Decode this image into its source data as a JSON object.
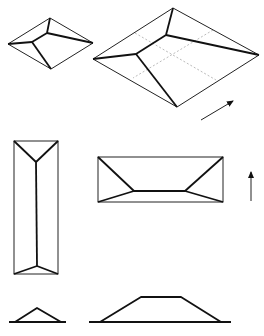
{
  "figure": {
    "colors": {
      "line": "#111111",
      "guide": "#aaaaaa",
      "background": "#ffffff"
    },
    "small_iso": {
      "outline": [
        [
          50,
          18
        ],
        [
          93,
          43
        ],
        [
          51,
          69
        ],
        [
          8,
          44
        ]
      ],
      "ridges": [
        [
          [
            50,
            18
          ],
          [
            47,
            33
          ]
        ],
        [
          [
            47,
            33
          ],
          [
            93,
            43
          ]
        ],
        [
          [
            47,
            33
          ],
          [
            32,
            42
          ]
        ],
        [
          [
            32,
            42
          ],
          [
            8,
            44
          ]
        ],
        [
          [
            32,
            42
          ],
          [
            51,
            69
          ]
        ]
      ]
    },
    "large_iso": {
      "outline": [
        [
          173,
          8
        ],
        [
          259,
          55
        ],
        [
          177,
          107
        ],
        [
          93,
          59
        ]
      ],
      "ridges": [
        [
          [
            173,
            8
          ],
          [
            166,
            35
          ]
        ],
        [
          [
            166,
            35
          ],
          [
            259,
            55
          ]
        ],
        [
          [
            166,
            35
          ],
          [
            136,
            54
          ]
        ],
        [
          [
            136,
            54
          ],
          [
            93,
            59
          ]
        ],
        [
          [
            136,
            54
          ],
          [
            177,
            107
          ]
        ]
      ],
      "guides": [
        [
          [
            135,
            33
          ],
          [
            216,
            80
          ]
        ],
        [
          [
            213,
            30
          ],
          [
            133,
            78
          ]
        ]
      ]
    },
    "iso_arrow": {
      "from": [
        201,
        120
      ],
      "to": [
        233,
        101
      ],
      "icon": "arrow-up-right-icon"
    },
    "plan_tall": {
      "rect": [
        14,
        141,
        58,
        274
      ],
      "ridges": [
        [
          [
            14,
            141
          ],
          [
            36,
            162
          ]
        ],
        [
          [
            58,
            141
          ],
          [
            36,
            162
          ]
        ],
        [
          [
            36,
            162
          ],
          [
            37,
            266
          ]
        ],
        [
          [
            37,
            266
          ],
          [
            14,
            274
          ]
        ],
        [
          [
            37,
            266
          ],
          [
            58,
            274
          ]
        ]
      ]
    },
    "plan_wide": {
      "rect": [
        98,
        157,
        223,
        202
      ],
      "ridges": [
        [
          [
            98,
            157
          ],
          [
            134,
            191
          ]
        ],
        [
          [
            223,
            157
          ],
          [
            185,
            191
          ]
        ],
        [
          [
            134,
            191
          ],
          [
            185,
            191
          ]
        ],
        [
          [
            134,
            191
          ],
          [
            98,
            202
          ]
        ],
        [
          [
            185,
            191
          ],
          [
            223,
            202
          ]
        ]
      ]
    },
    "plan_arrow": {
      "from": [
        251,
        201
      ],
      "to": [
        251,
        172
      ],
      "icon": "arrow-up-icon"
    },
    "elevation_small": {
      "ground": [
        [
          9,
          322
        ],
        [
          66,
          322
        ]
      ],
      "profile": [
        [
          15,
          322
        ],
        [
          37,
          308
        ],
        [
          61,
          322
        ]
      ]
    },
    "elevation_large": {
      "ground": [
        [
          89,
          322
        ],
        [
          231,
          322
        ]
      ],
      "profile": [
        [
          100,
          322
        ],
        [
          141,
          297
        ],
        [
          181,
          297
        ],
        [
          221,
          322
        ]
      ]
    }
  }
}
